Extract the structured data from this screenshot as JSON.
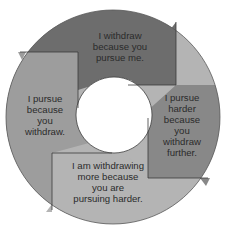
{
  "diagram": {
    "type": "cycle",
    "colors": {
      "background": "#ffffff",
      "top_segment": "#6d6d6d",
      "right_segment": "#888888",
      "bottom_segment": "#b4b4b4",
      "left_segment": "#9d9d9d",
      "outline": "#3a3a3a",
      "text": "#2b2b2b"
    },
    "segments": [
      {
        "id": "top",
        "position": "top",
        "lines": [
          "I withdraw",
          "because you",
          "pursue me."
        ]
      },
      {
        "id": "right",
        "position": "right",
        "lines": [
          "I pursue",
          "harder",
          "because",
          "you",
          "withdraw",
          "further."
        ]
      },
      {
        "id": "bottom",
        "position": "bottom",
        "lines": [
          "I am withdrawing",
          "more because",
          "you are",
          "pursuing harder."
        ]
      },
      {
        "id": "left",
        "position": "left",
        "lines": [
          "I pursue",
          "because",
          "you",
          "withdraw."
        ]
      }
    ]
  }
}
